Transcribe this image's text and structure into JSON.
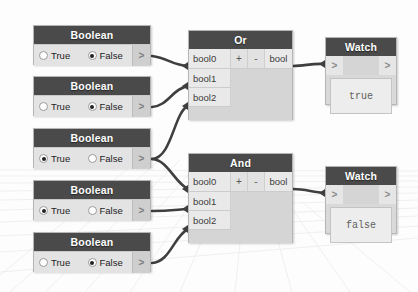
{
  "canvas": {
    "background_color": "#fdfdfd",
    "grid_color": "#e8e8e8",
    "wire_color": "#3f3f3f"
  },
  "theme": {
    "header_color": "#4a4a4a",
    "header_text_color": "#ffffff",
    "body_color": "#d9d9d9",
    "port_color": "#e9e9e9"
  },
  "boolean_nodes": [
    {
      "title": "Boolean",
      "true_label": "True",
      "false_label": "False",
      "selected": "False",
      "output_port": ">",
      "x": 33,
      "y": 25
    },
    {
      "title": "Boolean",
      "true_label": "True",
      "false_label": "False",
      "selected": "False",
      "output_port": ">",
      "x": 33,
      "y": 76
    },
    {
      "title": "Boolean",
      "true_label": "True",
      "false_label": "False",
      "selected": "True",
      "output_port": ">",
      "x": 33,
      "y": 128
    },
    {
      "title": "Boolean",
      "true_label": "True",
      "false_label": "False",
      "selected": "True",
      "output_port": ">",
      "x": 33,
      "y": 180
    },
    {
      "title": "Boolean",
      "true_label": "True",
      "false_label": "False",
      "selected": "False",
      "output_port": ">",
      "x": 33,
      "y": 232
    }
  ],
  "logic_nodes": [
    {
      "title": "Or",
      "inputs": [
        "bool0",
        "bool1",
        "bool2"
      ],
      "add_button": "+",
      "remove_button": "-",
      "output": "bool",
      "x": 188,
      "y": 30
    },
    {
      "title": "And",
      "inputs": [
        "bool0",
        "bool1",
        "bool2"
      ],
      "add_button": "+",
      "remove_button": "-",
      "output": "bool",
      "x": 188,
      "y": 153
    }
  ],
  "watch_nodes": [
    {
      "title": "Watch",
      "input_port": ">",
      "output_port": ">",
      "value": "true",
      "x": 325,
      "y": 37
    },
    {
      "title": "Watch",
      "input_port": ">",
      "output_port": ">",
      "value": "false",
      "x": 325,
      "y": 166
    }
  ]
}
